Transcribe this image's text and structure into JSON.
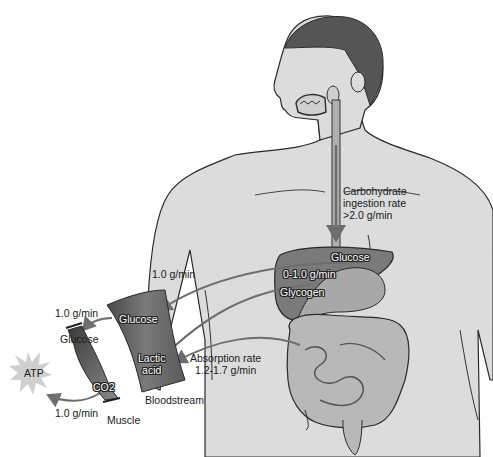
{
  "diagram": {
    "type": "carbohydrate-metabolism-flow",
    "labels": {
      "ingestion_rate": [
        "Carbohydrate",
        "ingestion rate",
        ">2.0 g/min"
      ],
      "liver_glucose": "Glucose",
      "liver_rate": "0-1.0 g/min",
      "liver_glycogen": "Glycogen",
      "liver_to_blood_rate": "1.0 g/min",
      "absorption_rate": [
        "Absorption rate",
        "1.2-1.7 g/min"
      ],
      "blood_glucose": "Glucose",
      "blood_lactic": [
        "Lactic",
        "acid"
      ],
      "bloodstream": "Bloodstream",
      "muscle_in_rate": "1.0 g/min",
      "muscle_glucose": "Glucose",
      "muscle_co2": "CO2",
      "muscle_out_rate": "1.0 g/min",
      "muscle": "Muscle",
      "atp": "ATP"
    },
    "colors": {
      "skin": "#dcdcdc",
      "hair": "#555555",
      "organs": "#7a7a7a",
      "organs_light": "#a8a8a8",
      "intestine": "#b8b8b8",
      "arrow": "#6e6e6e",
      "blood_vessel": "#666666",
      "atp_star": "#cfcfcf",
      "outline": "#2a2a2a"
    }
  }
}
